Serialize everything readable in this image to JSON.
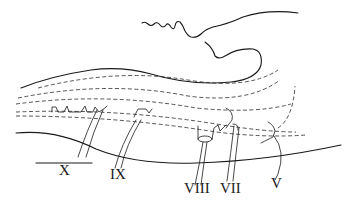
{
  "figure": {
    "type": "anatomical line drawing",
    "labels": [
      {
        "id": "X",
        "text": "X"
      },
      {
        "id": "IX",
        "text": "IX"
      },
      {
        "id": "VIII",
        "text": "VIII"
      },
      {
        "id": "VII",
        "text": "VII"
      },
      {
        "id": "V",
        "text": "V"
      }
    ],
    "colors": {
      "ink": "#1a1a1a",
      "background": "#ffffff"
    }
  }
}
